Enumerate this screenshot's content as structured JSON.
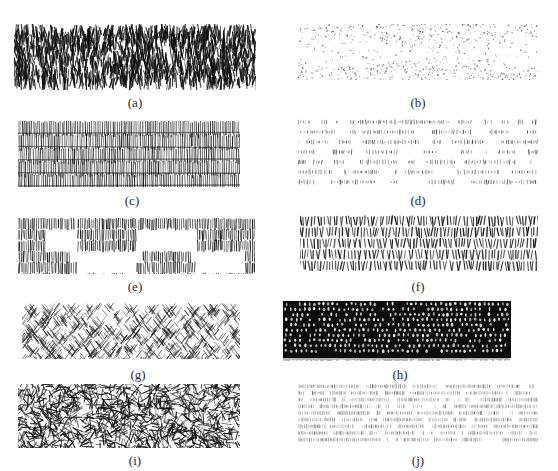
{
  "figure": {
    "panels": [
      {
        "id": "a",
        "label": "(a)",
        "texture": "dense-vertical-scribble",
        "ink": "#111111"
      },
      {
        "id": "b",
        "label": "(b)",
        "texture": "stipple-dots",
        "ink": "#555555"
      },
      {
        "id": "c",
        "label": "(c)",
        "texture": "vertical-hatch-rows",
        "ink": "#1a1a1a"
      },
      {
        "id": "d",
        "label": "(d)",
        "texture": "horizontal-dash-lines",
        "ink": "#333333"
      },
      {
        "id": "e",
        "label": "(e)",
        "texture": "vertical-hatch-with-gaps",
        "ink": "#1a1a1a"
      },
      {
        "id": "f",
        "label": "(f)",
        "texture": "short-vertical-strokes-rows",
        "ink": "#1a1a1a"
      },
      {
        "id": "g",
        "label": "(g)",
        "texture": "herringbone-diagonal",
        "ink": "#222222"
      },
      {
        "id": "h",
        "label": "(h)",
        "texture": "dense-cells",
        "ink": "#0d0d0d"
      },
      {
        "id": "i",
        "label": "(i)",
        "texture": "random-crosshatch-mesh",
        "ink": "#111111"
      },
      {
        "id": "j",
        "label": "(j)",
        "texture": "fine-tick-lines",
        "ink": "#444444"
      }
    ]
  }
}
